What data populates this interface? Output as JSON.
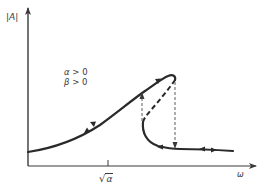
{
  "diagram": {
    "type": "frequency-response-hysteresis",
    "axes": {
      "y_label": "|A|",
      "x_label": "ω",
      "x_tick_label_symbol": "√",
      "x_tick_label_radicand": "α"
    },
    "conditions": [
      {
        "symbol": "α",
        "relation": " > 0"
      },
      {
        "symbol": "β",
        "relation": " > 0"
      }
    ],
    "curve": {
      "stable_branch_upper": "solid",
      "unstable_branch_middle": "dashed",
      "jump_up": "dashed arrow up",
      "jump_down": "dashed arrow down",
      "stroke_color": "#2a2a2a"
    }
  }
}
